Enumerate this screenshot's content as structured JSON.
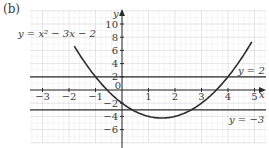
{
  "part_label": "(b)",
  "chart_data": {
    "type": "line",
    "title": "",
    "xlabel": "x",
    "ylabel": "y",
    "xlim": [
      -3.5,
      5.3
    ],
    "ylim": [
      -8,
      12
    ],
    "grid": true,
    "x_ticks": [
      -3,
      -2,
      -1,
      1,
      2,
      3,
      4,
      5
    ],
    "y_ticks": [
      10,
      8,
      6,
      4,
      2,
      0,
      -2,
      -4,
      -6
    ],
    "x_tick_labels": [
      "−3",
      "−2",
      "−1",
      "1",
      "2",
      "3",
      "4",
      "5"
    ],
    "y_tick_labels": [
      "10",
      "8",
      "6",
      "4",
      "2",
      "0",
      "−2",
      "−4",
      "−6"
    ],
    "series": [
      {
        "name": "y = x² − 3x − 2",
        "type": "curve",
        "equation": "x^2 - 3x - 2",
        "x_range": [
          -1.8,
          4.9
        ],
        "x": [
          -1.8,
          -1,
          0,
          1,
          1.5,
          2,
          3,
          4,
          4.9
        ],
        "y": [
          4.64,
          2,
          -2,
          -4,
          -4.25,
          -4,
          -2,
          2,
          7.31
        ]
      },
      {
        "name": "y = 2",
        "type": "horizontal",
        "y": 2
      },
      {
        "name": "y = −3",
        "type": "horizontal",
        "y": -3
      }
    ],
    "annotations": [
      {
        "text": "y = x² − 3x − 2",
        "position": "upper-left"
      },
      {
        "text": "y = 2",
        "position": "right, above line"
      },
      {
        "text": "y = −3",
        "position": "right, below line"
      }
    ]
  },
  "labels": {
    "curve": "y = x² − 3x − 2",
    "line_top": "y = 2",
    "line_bottom": "y = −3",
    "x_axis": "x",
    "y_axis": "y",
    "origin": "0"
  }
}
